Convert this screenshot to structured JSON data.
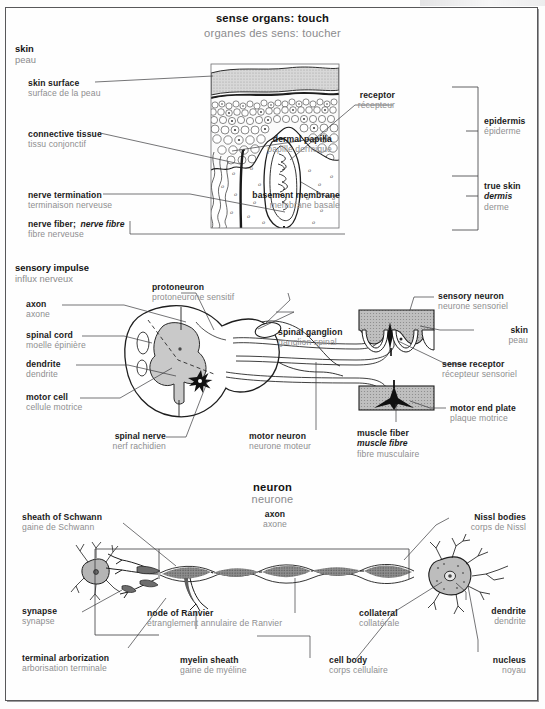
{
  "page": {
    "title_en": "sense organs: touch",
    "title_fr": "organes des sens: toucher"
  },
  "sections": [
    {
      "id": "skin",
      "en": "skin",
      "fr": "peau"
    },
    {
      "id": "impulse",
      "en": "sensory impulse",
      "fr": "influx nerveux"
    },
    {
      "id": "neuron",
      "en": "neuron",
      "fr": "neurone"
    }
  ],
  "skin_diagram": {
    "labels_left": [
      {
        "en": "skin surface",
        "fr": "surface de la peau"
      },
      {
        "en": "connective tissue",
        "fr": "tissu conjonctif"
      },
      {
        "en": "nerve termination",
        "fr": "terminaison nerveuse"
      },
      {
        "en": "nerve fiber;",
        "en_italic": "nerve fibre",
        "fr": "fibre nerveuse"
      }
    ],
    "labels_right": [
      {
        "en": "receptor",
        "fr": "récepteur"
      },
      {
        "en": "dermal papilla",
        "fr": "papille dermique"
      },
      {
        "en": "basement membrane",
        "fr": "membrane basale"
      }
    ],
    "brackets": [
      {
        "en": "epidermis",
        "fr": "épiderme"
      },
      {
        "en": "true skin",
        "en_italic": "dermis",
        "fr": "derme"
      }
    ]
  },
  "impulse_diagram": {
    "labels_left": [
      {
        "en": "axon",
        "fr": "axone"
      },
      {
        "en": "spinal cord",
        "fr": "moelle épinière"
      },
      {
        "en": "dendrite",
        "fr": "dendrite"
      },
      {
        "en": "motor cell",
        "fr": "cellule motrice"
      }
    ],
    "labels_top": [
      {
        "en": "protoneuron",
        "fr": "protoneurone sensitif"
      }
    ],
    "labels_inner": [
      {
        "en": "spinal ganglion",
        "fr": "ganglion spinal"
      }
    ],
    "labels_bottom": [
      {
        "en": "spinal nerve",
        "fr": "nerf rachidien"
      },
      {
        "en": "motor neuron",
        "fr": "neurone moteur"
      },
      {
        "en": "muscle fiber",
        "en_italic": "muscle fibre",
        "fr": "fibre musculaire"
      }
    ],
    "labels_right": [
      {
        "en": "sensory neuron",
        "fr": "neurone sensoriel"
      },
      {
        "en": "skin",
        "fr": "peau"
      },
      {
        "en": "sense receptor",
        "fr": "récepteur sensoriel"
      },
      {
        "en": "motor end plate",
        "fr": "plaque motrice"
      }
    ]
  },
  "neuron_diagram": {
    "label_axon": {
      "en": "axon",
      "fr": "axone"
    },
    "labels_left": [
      {
        "en": "sheath of Schwann",
        "fr": "gaine de Schwann"
      },
      {
        "en": "synapse",
        "fr": "synapse"
      },
      {
        "en": "terminal arborization",
        "fr": "arborisation terminale"
      }
    ],
    "labels_mid": [
      {
        "en": "node of Ranvier",
        "fr": "étranglement annulaire de Ranvier"
      },
      {
        "en": "myelin sheath",
        "fr": "gaine de myéline"
      },
      {
        "en": "collateral",
        "fr": "collatérale"
      },
      {
        "en": "cell body",
        "fr": "corps cellulaire"
      }
    ],
    "labels_right": [
      {
        "en": "Nissl bodies",
        "fr": "corps de Nissl"
      },
      {
        "en": "dendrite",
        "fr": "dendrite"
      },
      {
        "en": "nucleus",
        "fr": "noyau"
      }
    ]
  },
  "colors": {
    "frame": "#58585a",
    "english_text": "#1b1b1b",
    "french_text": "#8e8e90",
    "leader_line": "#3a3a3c",
    "tissue_fill": "#c9c9c9",
    "light_fill": "#e3e3e3",
    "dark_fill": "#4a4a4a"
  }
}
